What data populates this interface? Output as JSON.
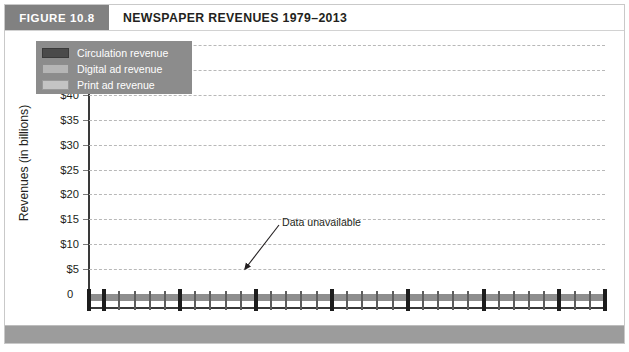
{
  "figure": {
    "badge": "FIGURE 10.8",
    "title": "NEWSPAPER REVENUES 1979–2013"
  },
  "colors": {
    "circulation": "#4a4a4a",
    "digital": "#b5b5b5",
    "print": "#c4c4c4",
    "badge_bg": "#818181",
    "legend_bg": "#8c8c8c",
    "axis": "#3a3a3a",
    "grid": "#b8b8b8",
    "footer_bg": "#9c9c9c"
  },
  "legend": {
    "items": [
      {
        "label": "Circulation revenue",
        "color": "#4a4a4a"
      },
      {
        "label": "Digital ad revenue",
        "color": "#b5b5b5"
      },
      {
        "label": "Print ad revenue",
        "color": "#c4c4c4"
      }
    ]
  },
  "annotation": {
    "label": "Data unavailable"
  },
  "axis": {
    "y_title": "Revenues (in billions)",
    "y_ticks": [
      "$50",
      "$45",
      "$40",
      "$35",
      "$30",
      "$25",
      "$20",
      "$15",
      "$10",
      "$5",
      "0"
    ],
    "x_tick_labels": [
      "1979",
      "1980",
      "1985",
      "1990",
      "1995",
      "2000",
      "2005",
      "2010",
      "2013"
    ]
  },
  "chart_data": {
    "type": "line",
    "title": "NEWSPAPER REVENUES 1979–2013",
    "xlabel": "",
    "ylabel": "Revenues (in billions)",
    "ylim": [
      0,
      50
    ],
    "xlim": [
      1979,
      2013
    ],
    "ytick_values": [
      0,
      5,
      10,
      15,
      20,
      25,
      30,
      35,
      40,
      45,
      50
    ],
    "ytick_labels": [
      "0",
      "$5",
      "$10",
      "$15",
      "$20",
      "$25",
      "$30",
      "$35",
      "$40",
      "$45",
      "$50"
    ],
    "xtick_values": [
      1979,
      1980,
      1985,
      1990,
      1995,
      2000,
      2005,
      2010,
      2013
    ],
    "grid": "horizontal-dashed",
    "legend_position": "upper-left-inside",
    "annotations": [
      {
        "text": "Data unavailable",
        "points_to_year": 1990,
        "points_to_value": 9.4
      }
    ],
    "series": [
      {
        "name": "Print ad revenue",
        "color": "#c4c4c4",
        "x": [
          1979,
          1980,
          1981,
          1982,
          1983,
          1984,
          1985,
          1986,
          1987,
          1988,
          1989,
          1990,
          1991,
          1992,
          1993,
          1994,
          1995,
          1996,
          1997,
          1998,
          1999,
          2000,
          2001,
          2002,
          2003,
          2004,
          2005,
          2006,
          2007,
          2008,
          2009,
          2010,
          2011,
          2012,
          2013
        ],
        "y": [
          14.5,
          16.0,
          17.5,
          18.5,
          20.5,
          23.5,
          25.0,
          27.0,
          29.0,
          31.5,
          32.3,
          30.5,
          30.3,
          30.8,
          32.0,
          34.4,
          36.1,
          38.4,
          41.3,
          43.9,
          46.3,
          48.7,
          44.3,
          44.1,
          44.9,
          46.7,
          47.4,
          46.6,
          42.2,
          34.7,
          24.8,
          22.8,
          20.7,
          18.9,
          20.0
        ]
      },
      {
        "name": "Circulation revenue",
        "color": "#4a4a4a",
        "segments": [
          {
            "x": [
              1979,
              1980,
              1981,
              1982,
              1983,
              1984,
              1985,
              1986,
              1987,
              1988,
              1989
            ],
            "y": [
              5.1,
              5.5,
              5.9,
              6.3,
              6.7,
              7.1,
              7.6,
              8.0,
              8.4,
              8.8,
              9.3
            ]
          },
          {
            "x": [
              1991,
              1992,
              1993,
              1994,
              1995,
              1996,
              1997,
              1998,
              1999,
              2000,
              2001,
              2002,
              2003,
              2004,
              2005,
              2006,
              2007,
              2008,
              2009,
              2010,
              2011,
              2012,
              2013
            ],
            "y": [
              9.4,
              9.5,
              9.6,
              9.7,
              10.0,
              10.1,
              10.2,
              10.3,
              10.5,
              10.6,
              10.7,
              10.8,
              11.0,
              10.9,
              10.7,
              10.5,
              10.3,
              10.1,
              10.1,
              10.0,
              10.2,
              10.5,
              10.8
            ]
          }
        ]
      },
      {
        "name": "Digital ad revenue",
        "color": "#b5b5b5",
        "x": [
          2002,
          2003,
          2004,
          2005,
          2006,
          2007,
          2008,
          2009,
          2010,
          2011,
          2012,
          2013
        ],
        "y": [
          0.0,
          1.2,
          1.5,
          2.0,
          2.7,
          3.2,
          3.1,
          2.7,
          3.0,
          3.2,
          3.4,
          3.5
        ]
      }
    ]
  }
}
